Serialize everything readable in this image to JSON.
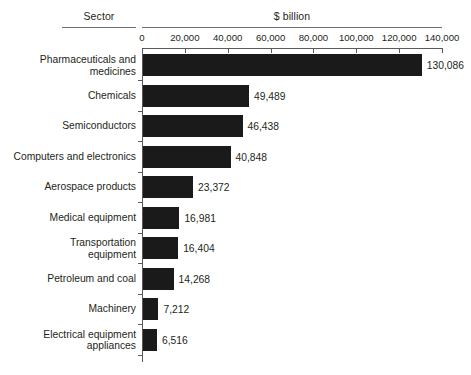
{
  "header": {
    "sector_label": "Sector",
    "unit_label": "$ billion"
  },
  "chart_data": {
    "type": "bar",
    "orientation": "horizontal",
    "title": "",
    "xlabel": "$ billion",
    "ylabel": "Sector",
    "xlim": [
      0,
      140000
    ],
    "xticks": [
      0,
      20000,
      40000,
      60000,
      80000,
      100000,
      120000,
      140000
    ],
    "xticklabels": [
      "0",
      "20,000",
      "40,000",
      "60,000",
      "80,000",
      "100,000",
      "120,000",
      "140,000"
    ],
    "grid": false,
    "legend": null,
    "bar_color": "#1a1a1a",
    "categories": [
      "Pharmaceuticals and\nmedicines",
      "Chemicals",
      "Semiconductors",
      "Computers and electronics",
      "Aerospace products",
      "Medical equipment",
      "Transportation\nequipment",
      "Petroleum and coal",
      "Machinery",
      "Electrical equipment\nappliances"
    ],
    "values": [
      130086,
      49489,
      46438,
      40848,
      23372,
      16981,
      16404,
      14268,
      7212,
      6516
    ],
    "value_labels": [
      "130,086",
      "49,489",
      "46,438",
      "40,848",
      "23,372",
      "16,981",
      "16,404",
      "14,268",
      "7,212",
      "6,516"
    ]
  }
}
